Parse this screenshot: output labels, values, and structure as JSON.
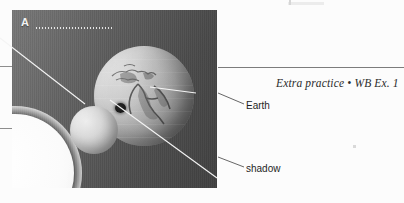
{
  "figure": {
    "item_letter": "A",
    "answer_line": "dotted-answer-line",
    "panel_caption_note": "",
    "scene": {
      "sun": {
        "name": "Sun",
        "color": "#ffffff"
      },
      "earth": {
        "name": "Earth",
        "color": "#c0c0c0"
      },
      "moon": {
        "name": "Moon",
        "color": "#dcdcdc"
      },
      "shadow_spot": {
        "name": "umbra shadow",
        "color": "#1a1a1a"
      },
      "background_color": "#5e5e5e"
    }
  },
  "annotations": [
    {
      "label": "Earth",
      "target": "earth-globe"
    },
    {
      "label": "shadow",
      "target": "shadow-spot"
    }
  ],
  "caption": {
    "text": "Extra practice • WB Ex. 1"
  },
  "colors": {
    "panel_background": "#5e5e5e",
    "leader_line": "#ffffff",
    "annotation_leader": "#555555",
    "text": "#1f1f1f",
    "rule": "#8d8d8d"
  }
}
